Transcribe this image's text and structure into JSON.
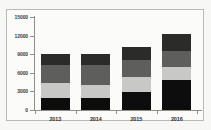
{
  "chart_data": {
    "type": "bar",
    "subtype": "stacked-bar",
    "title": "",
    "subtitle": "",
    "xlabel": "",
    "ylabel": "",
    "categories": [
      "2013",
      "2014",
      "2015",
      "2016"
    ],
    "ylim": [
      0,
      15000
    ],
    "yticks": [
      0,
      3000,
      6000,
      9000,
      12000,
      15000
    ],
    "ytick_labels": [
      "0",
      "3000",
      "6000",
      "9000",
      "12000",
      "15000"
    ],
    "grid": false,
    "legend": false,
    "legend_position": "none",
    "series": [
      {
        "name": "Series 1",
        "color": "#0d0d0d",
        "values": [
          2000,
          2000,
          2900,
          4900
        ]
      },
      {
        "name": "Series 2",
        "color": "#c8c8c6",
        "values": [
          2300,
          2100,
          2500,
          2000
        ]
      },
      {
        "name": "Series 3",
        "color": "#5e5e5c",
        "values": [
          3000,
          3200,
          2700,
          2700
        ]
      },
      {
        "name": "Series 4",
        "color": "#2b2b2a",
        "values": [
          1700,
          1800,
          2000,
          2600
        ]
      }
    ],
    "totals": [
      9000,
      9100,
      10100,
      12200
    ]
  },
  "style": {
    "page_background": "#f7f7f5",
    "plot_background": "#fbfbf9",
    "frame_border": "#b9b9b6",
    "axis_color": "#8e8e8b",
    "tick_label_color": "#3a3a38"
  }
}
